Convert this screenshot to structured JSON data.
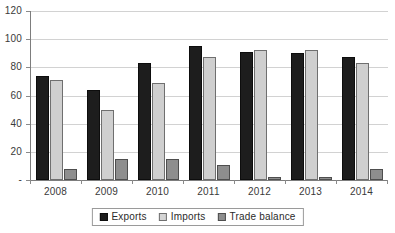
{
  "chart_data": {
    "type": "bar",
    "title": "",
    "subtitle": "",
    "xlabel": "",
    "ylabel": "",
    "categories": [
      "2008",
      "2009",
      "2010",
      "2011",
      "2012",
      "2013",
      "2014"
    ],
    "series": [
      {
        "name": "Exports",
        "color": "#1d1d1d",
        "values": [
          74,
          64,
          83,
          95,
          91,
          90,
          87
        ]
      },
      {
        "name": "Imports",
        "color": "#cfcfcf",
        "values": [
          71,
          50,
          69,
          87,
          92,
          92,
          83
        ]
      },
      {
        "name": "Trade balance",
        "color": "#8e8e8e",
        "values": [
          8,
          15,
          15,
          11,
          2,
          2,
          8
        ]
      }
    ],
    "ylim": [
      0,
      120
    ],
    "ytick_values": [
      0,
      20,
      40,
      60,
      80,
      100,
      120
    ],
    "ytick_labels": [
      "-",
      "20",
      "40",
      "60",
      "80",
      "100",
      "120"
    ],
    "grid": true,
    "legend_position": "bottom"
  }
}
